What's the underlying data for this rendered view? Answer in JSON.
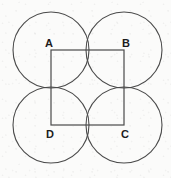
{
  "figure": {
    "name": "four-circles-inscribed-square",
    "canvas": {
      "width": 171,
      "height": 178
    },
    "colors": {
      "background": "#fbfbfa",
      "stroke": "#4a4a4a",
      "square_stroke": "#4a4a4a",
      "shaded_region_fill": "#d2d2d2",
      "shaded_region_stroke": "#6b6b6b",
      "label_color": "#1c1c1c"
    },
    "square": {
      "label": "ABCD",
      "side_px": 73,
      "stroke_width": 1.2,
      "corners": [
        {
          "name": "A",
          "x": 51,
          "y": 50
        },
        {
          "name": "B",
          "x": 124,
          "y": 50
        },
        {
          "name": "C",
          "x": 124,
          "y": 125
        },
        {
          "name": "D",
          "x": 51,
          "y": 125
        }
      ]
    },
    "circles": [
      {
        "name": "circle-at-A",
        "cx": 51,
        "cy": 50,
        "r": 38
      },
      {
        "name": "circle-at-B",
        "cx": 124,
        "cy": 50,
        "r": 38
      },
      {
        "name": "circle-at-C",
        "cx": 124,
        "cy": 125,
        "r": 38
      },
      {
        "name": "circle-at-D",
        "cx": 51,
        "cy": 125,
        "r": 38
      }
    ],
    "shaded_region": {
      "name": "central-astroid",
      "description": "concave curvilinear quadrilateral at square center",
      "center": {
        "x": 87.5,
        "y": 87.5
      },
      "cusps": [
        {
          "x": 87.5,
          "y": 62.0
        },
        {
          "x": 113.0,
          "y": 87.5
        },
        {
          "x": 87.5,
          "y": 113.0
        },
        {
          "x": 62.0,
          "y": 87.5
        }
      ]
    },
    "labels": [
      {
        "key": "A",
        "text": "A",
        "x": 49,
        "y": 47,
        "anchor": "middle"
      },
      {
        "key": "B",
        "text": "B",
        "x": 126,
        "y": 47,
        "anchor": "middle"
      },
      {
        "key": "C",
        "text": "C",
        "x": 125,
        "y": 138,
        "anchor": "middle"
      },
      {
        "key": "D",
        "text": "D",
        "x": 50,
        "y": 138,
        "anchor": "middle"
      }
    ]
  }
}
